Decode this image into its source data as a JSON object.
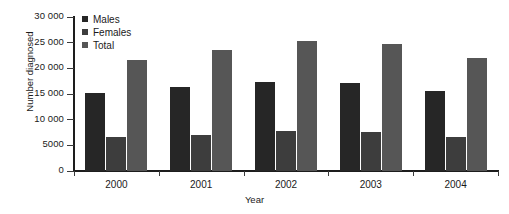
{
  "chart_data": {
    "type": "bar",
    "title": "",
    "xlabel": "Year",
    "ylabel": "Number diagnosed",
    "categories": [
      "2000",
      "2001",
      "2002",
      "2003",
      "2004"
    ],
    "series": [
      {
        "name": "Males",
        "color": "#262626",
        "values": [
          15200,
          16300,
          17400,
          17100,
          15600
        ]
      },
      {
        "name": "Females",
        "color": "#3d3d3d",
        "values": [
          6600,
          7000,
          7800,
          7600,
          6600
        ]
      },
      {
        "name": "Total",
        "color": "#565656",
        "values": [
          21700,
          23500,
          25400,
          24700,
          22100
        ]
      }
    ],
    "ylim": [
      0,
      30000
    ],
    "yticks": [
      0,
      5000,
      10000,
      15000,
      20000,
      25000,
      30000
    ],
    "ytick_labels": [
      "0",
      "5000",
      "10 000",
      "15 000",
      "20 000",
      "25 000",
      "30 000"
    ],
    "grid": false,
    "legend_position": "top-left",
    "legend_entries": [
      "Males",
      "Females",
      "Total"
    ],
    "axis_color": "#1d1d1d",
    "background_color": "#ffffff"
  }
}
